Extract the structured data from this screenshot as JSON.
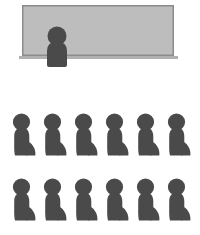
{
  "scene": {
    "title": "Classroom with teacher at whiteboard and two rows of seated students",
    "width": 200,
    "height": 235,
    "background_color": "#FFFFFF"
  },
  "palette": {
    "background": "#FFFFFF",
    "board_fill": "#BDBDBD",
    "board_border": "#8C8C8C",
    "board_ledge": "#B0B0B0",
    "figure": "#4A4A4A"
  },
  "board": {
    "name": "whiteboard",
    "label": "Whiteboard",
    "x": 22,
    "y": 5,
    "width": 152,
    "height": 51,
    "fill": "#BDBDBD",
    "border_color": "#8C8C8C",
    "border_width": 1.5,
    "content_text": "",
    "ledge": {
      "label": "Board ledge",
      "x": 19,
      "y": 56,
      "width": 159,
      "height": 3,
      "fill": "#B0B0B0"
    }
  },
  "teacher": {
    "name": "teacher",
    "label": "Teacher",
    "orientation": "front-facing",
    "fill": "#4A4A4A",
    "head": {
      "cx": 57,
      "cy": 36,
      "r": 9.5
    },
    "body": {
      "x": 47,
      "y": 42,
      "width": 20,
      "height": 25,
      "top_radius": 9,
      "bottom_radius": 2
    }
  },
  "students": {
    "label": "Students",
    "count": 12,
    "rows": 2,
    "per_row": 6,
    "fill": "#4A4A4A",
    "orientation": "side-profile facing right",
    "spacing_x": 31,
    "start_x": 11,
    "figure_width": 26,
    "figure_height": 43,
    "row_tops": [
      113,
      178
    ],
    "columns_x": [
      11,
      42,
      73,
      104,
      135,
      166
    ],
    "seats": [
      {
        "row": 1,
        "col": 1,
        "x": 11,
        "y": 113
      },
      {
        "row": 1,
        "col": 2,
        "x": 42,
        "y": 113
      },
      {
        "row": 1,
        "col": 3,
        "x": 73,
        "y": 113
      },
      {
        "row": 1,
        "col": 4,
        "x": 104,
        "y": 113
      },
      {
        "row": 1,
        "col": 5,
        "x": 135,
        "y": 113
      },
      {
        "row": 1,
        "col": 6,
        "x": 166,
        "y": 113
      },
      {
        "row": 2,
        "col": 1,
        "x": 11,
        "y": 178
      },
      {
        "row": 2,
        "col": 2,
        "x": 42,
        "y": 178
      },
      {
        "row": 2,
        "col": 3,
        "x": 73,
        "y": 178
      },
      {
        "row": 2,
        "col": 4,
        "x": 104,
        "y": 178
      },
      {
        "row": 2,
        "col": 5,
        "x": 135,
        "y": 178
      },
      {
        "row": 2,
        "col": 6,
        "x": 166,
        "y": 178
      }
    ]
  }
}
